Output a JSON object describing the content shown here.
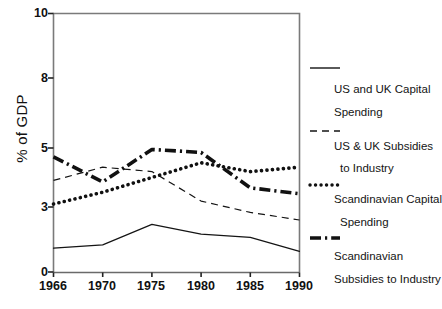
{
  "chart_data": {
    "type": "line",
    "title": "",
    "xlabel": "",
    "ylabel": "% of GDP",
    "categories": [
      "1966",
      "1970",
      "1975",
      "1980",
      "1985",
      "1990"
    ],
    "x": [
      1966,
      1970,
      1975,
      1980,
      1985,
      1990
    ],
    "ytick_labels": [
      "0",
      "3",
      "5",
      "8",
      "10"
    ],
    "ytick_values": [
      0,
      3,
      5,
      8,
      10
    ],
    "ylim": [
      0,
      10
    ],
    "grid": false,
    "legend_position": "right",
    "series": [
      {
        "name": "US and UK Capital Spending",
        "style": "solid-thin",
        "values": [
          1.1,
          1.25,
          2.2,
          1.75,
          1.6,
          0.95
        ]
      },
      {
        "name": "US & UK Subsidies to Industry",
        "style": "dashed-thin",
        "values": [
          3.9,
          4.35,
          4.2,
          3.2,
          2.75,
          2.4
        ]
      },
      {
        "name": "Scandinavian Capital Spending",
        "style": "dotted-bold",
        "values": [
          3.1,
          3.5,
          4.0,
          4.5,
          4.2,
          4.35
        ]
      },
      {
        "name": "Scandinavian Subsidies to Industry",
        "style": "dashdot-bold",
        "values": [
          4.7,
          3.85,
          4.95,
          4.85,
          3.65,
          3.45
        ]
      }
    ]
  },
  "axis": {
    "y_title": "% of GDP",
    "y_ticks": [
      "10",
      "8",
      "5",
      "3",
      "0"
    ],
    "x_ticks": [
      "1966",
      "1970",
      "1975",
      "1980",
      "1985",
      "1990"
    ]
  },
  "legend": {
    "entries": [
      {
        "swatch": "solid-thin-line-icon",
        "line1": "US and UK Capital",
        "line2": "Spending"
      },
      {
        "swatch": "dashed-thin-line-icon",
        "line1": "US & UK Subsidies",
        "line2": "to Industry"
      },
      {
        "swatch": "dotted-bold-line-icon",
        "line1": "Scandinavian Capital",
        "line2": "Spending"
      },
      {
        "swatch": "dashdot-bold-line-icon",
        "line1": "Scandinavian",
        "line2": "Subsidies to Industry"
      }
    ]
  },
  "colors": {
    "ink": "#111111",
    "axis": "#6b6b6b",
    "background": "#ffffff"
  }
}
